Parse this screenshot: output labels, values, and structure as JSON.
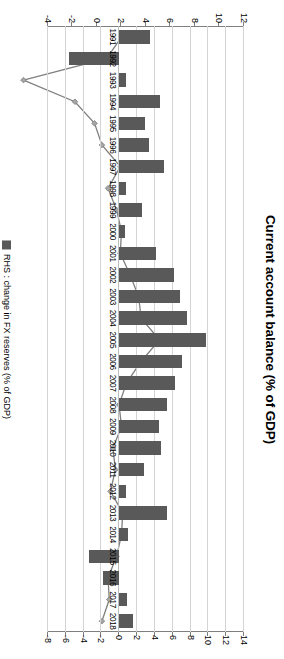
{
  "chart_data": {
    "type": "bar",
    "title": "Current account balance (% of GDP)",
    "xlabel": "",
    "ylabel": "",
    "grid": true,
    "legend_position": "bottom",
    "orientation": "rotated-90-ccw",
    "categories": [
      "1991",
      "1992",
      "1993",
      "1994",
      "1995",
      "1996",
      "1997",
      "1998",
      "1999",
      "2000",
      "2001",
      "2002",
      "2003",
      "2004",
      "2005",
      "2006",
      "2007",
      "2008",
      "2009",
      "2010",
      "2011",
      "2012",
      "2013",
      "2014",
      "2015",
      "2016",
      "2017",
      "2018"
    ],
    "series": [
      {
        "name": "Current account balance (% of GDP)",
        "type": "line",
        "axis": "left",
        "color": "#808080",
        "marker": "diamond",
        "values": [
          2.0,
          0.8,
          -6.0,
          -1.8,
          -0.2,
          0.4,
          1.9,
          0.9,
          1.6,
          2.0,
          1.9,
          2.7,
          3.4,
          3.6,
          5.1,
          3.6,
          2.4,
          1.8,
          2.0,
          1.3,
          1.5,
          1.1,
          2.1,
          2.0,
          1.6,
          0.9,
          1.0,
          0.4
        ]
      },
      {
        "name": "RHS : change in FX reserves (% of GDP)",
        "type": "bar",
        "axis": "right",
        "color": "#595959",
        "values": [
          3.5,
          -5.6,
          0.8,
          4.6,
          2.9,
          3.3,
          5.0,
          0.8,
          2.5,
          0.6,
          4.1,
          6.1,
          6.8,
          7.6,
          9.7,
          7.0,
          6.2,
          5.4,
          4.5,
          4.7,
          2.8,
          0.8,
          5.4,
          1.0,
          -3.4,
          -1.8,
          0.9,
          1.5
        ]
      }
    ],
    "left_axis": {
      "label": "",
      "ticks": [
        12,
        10,
        8,
        6,
        4,
        2,
        0,
        -2,
        -4
      ],
      "min": -4,
      "max": 12
    },
    "right_axis": {
      "label": "",
      "ticks": [
        14,
        12,
        10,
        8,
        6,
        4,
        2,
        0,
        -2,
        -4,
        -6,
        -8
      ],
      "min": -8,
      "max": 14
    },
    "legend": [
      {
        "label": "RHS : change in FX reserves (% of GDP)",
        "color": "#595959",
        "marker": "square"
      }
    ]
  }
}
